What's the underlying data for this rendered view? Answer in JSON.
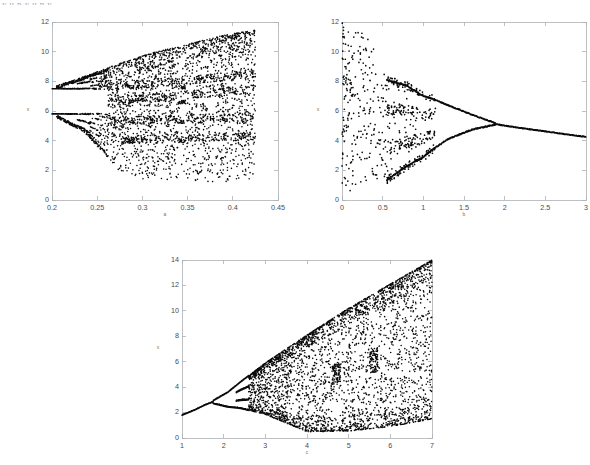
{
  "page": {
    "background_color": "#ffffff",
    "width": 590,
    "height": 465,
    "top_edge_artifact": "y u p  y  u p y",
    "axis_color": "#aeb0b3",
    "dot_color": "#0b0b0b",
    "tick_label_color": "#4a4c4f"
  },
  "chart_data": [
    {
      "id": "top-left",
      "type": "scatter",
      "title": "",
      "subtitle": "",
      "xlabel": "a",
      "ylabel": "x",
      "xlim": [
        0.2,
        0.45
      ],
      "ylim": [
        0,
        12
      ],
      "xticks": [
        0.2,
        0.25,
        0.3,
        0.35,
        0.4,
        0.45
      ],
      "xticklabels": [
        "0.2",
        "0.25",
        "0.3",
        "0.35",
        "0.4",
        "0.45"
      ],
      "yticks": [
        0,
        2,
        4,
        6,
        8,
        10,
        12
      ],
      "yticklabels": [
        "0",
        "2",
        "4",
        "6",
        "8",
        "10",
        "12"
      ],
      "grid": false,
      "legend": "none",
      "box": true,
      "description": "Period-doubling route to chaos; data spans x from 0.2 to about 0.425, attractor fans out from two branches near y=5.8 and y=7.5 into a broad chaotic band rising to y=11.4 at the right edge and descending to y=1.2 at the bottom.",
      "point_count": 4200,
      "param_start": 0.2,
      "param_end": 0.425,
      "branch_seeds": [
        5.8,
        7.5
      ],
      "upper_envelope": [
        [
          0.2,
          7.6
        ],
        [
          0.235,
          8.3
        ],
        [
          0.27,
          9.1
        ],
        [
          0.31,
          9.9
        ],
        [
          0.35,
          10.5
        ],
        [
          0.39,
          11.1
        ],
        [
          0.425,
          11.45
        ]
      ],
      "lower_envelope": [
        [
          0.2,
          5.7
        ],
        [
          0.235,
          4.6
        ],
        [
          0.26,
          3.0
        ],
        [
          0.275,
          1.9
        ],
        [
          0.3,
          1.35
        ],
        [
          0.35,
          1.25
        ],
        [
          0.425,
          1.2
        ]
      ],
      "bifurcation_points": [
        0.205,
        0.228,
        0.242,
        0.252,
        0.262
      ],
      "dense_bands": [
        7.6,
        6.6,
        5.3,
        4.0
      ],
      "window_gaps": [
        [
          0.285,
          0.292
        ],
        [
          0.34,
          0.348
        ]
      ]
    },
    {
      "id": "top-right",
      "type": "scatter",
      "title": "",
      "subtitle": "",
      "xlabel": "b",
      "ylabel": "x",
      "xlim": [
        0,
        3
      ],
      "ylim": [
        0,
        12
      ],
      "xticks": [
        0,
        0.5,
        1,
        1.5,
        2,
        2.5,
        3
      ],
      "xticklabels": [
        "0",
        "0.5",
        "1",
        "1.5",
        "2",
        "2.5",
        "3"
      ],
      "yticks": [
        0,
        2,
        4,
        6,
        8,
        10,
        12
      ],
      "yticklabels": [
        "0",
        "2",
        "4",
        "6",
        "8",
        "10",
        "12"
      ],
      "grid": false,
      "legend": "none",
      "box": true,
      "description": "Reverse period-doubling (period-halving) cascade. Chaotic scatter fills x<0.55 spanning y from 0.4 to 12, then collapses through period-8 and period-4 bands, merges to two branches near x=1.15, which converge at about x=1.9, y=5.1 and continue as a single branch falling to y=4.25 at x=3.",
      "point_count": 1500,
      "chaos_end": 0.55,
      "merge_points": [
        1.05,
        1.15,
        1.9
      ],
      "final_value_at_xmax": 4.25,
      "merge_value": 5.1,
      "upper_branch": [
        [
          0.55,
          8.1
        ],
        [
          0.8,
          7.7
        ],
        [
          1.0,
          7.0
        ],
        [
          1.1,
          6.85
        ],
        [
          1.3,
          6.4
        ],
        [
          1.6,
          5.75
        ],
        [
          1.9,
          5.15
        ]
      ],
      "lower_branch": [
        [
          0.55,
          1.35
        ],
        [
          0.8,
          2.3
        ],
        [
          1.0,
          2.9
        ],
        [
          1.1,
          3.35
        ],
        [
          1.3,
          4.1
        ],
        [
          1.6,
          4.75
        ],
        [
          1.9,
          5.1
        ]
      ],
      "single_branch": [
        [
          1.9,
          5.1
        ],
        [
          2.2,
          4.85
        ],
        [
          2.6,
          4.55
        ],
        [
          3.0,
          4.25
        ]
      ]
    },
    {
      "id": "bottom",
      "type": "scatter",
      "title": "",
      "subtitle": "",
      "xlabel": "c",
      "ylabel": "x",
      "xlim": [
        1,
        7
      ],
      "ylim": [
        0,
        14
      ],
      "xticks": [
        1,
        2,
        3,
        4,
        5,
        6,
        7
      ],
      "xticklabels": [
        "1",
        "2",
        "3",
        "4",
        "5",
        "6",
        "7"
      ],
      "yticks": [
        0,
        2,
        4,
        6,
        8,
        10,
        12,
        14
      ],
      "yticklabels": [
        "0",
        "2",
        "4",
        "6",
        "8",
        "10",
        "12",
        "14"
      ],
      "grid": false,
      "legend": "none",
      "box": true,
      "description": "Classic period-doubling bifurcation. A single fixed-point branch starts at (1, 1.8), rises to the first pitchfork at x=1.75, splits again near x=2.3, then becomes chaotic past x=2.6 with a wedge that widens to the full range 0.45 to 14 at x=7.",
      "point_count": 4500,
      "fixed_point_start": 1.8,
      "first_bifurcation": 1.75,
      "second_bifurcation": 2.3,
      "chaos_onset": 2.6,
      "fixed_branch": [
        [
          1.0,
          1.8
        ],
        [
          1.3,
          2.2
        ],
        [
          1.55,
          2.6
        ],
        [
          1.75,
          2.85
        ]
      ],
      "upper_envelope": [
        [
          1.75,
          2.95
        ],
        [
          2.1,
          3.6
        ],
        [
          2.4,
          4.4
        ],
        [
          3.0,
          5.9
        ],
        [
          4.0,
          8.1
        ],
        [
          5.0,
          10.2
        ],
        [
          6.0,
          12.1
        ],
        [
          7.0,
          14.0
        ]
      ],
      "lower_envelope": [
        [
          1.75,
          2.72
        ],
        [
          2.1,
          2.45
        ],
        [
          2.4,
          2.35
        ],
        [
          3.0,
          1.85
        ],
        [
          4.0,
          0.5
        ],
        [
          5.0,
          0.55
        ],
        [
          6.0,
          0.9
        ],
        [
          7.0,
          1.5
        ]
      ],
      "dense_bands": [
        13.0,
        10.5,
        6.2,
        2.1
      ],
      "window_gaps": [
        [
          4.6,
          4.8
        ],
        [
          5.5,
          5.7
        ]
      ]
    }
  ],
  "panels": [
    {
      "name": "top-left-panel",
      "left": 14,
      "top": 12,
      "width": 264,
      "height": 200,
      "plot_left": 38,
      "plot_top": 10,
      "plot_width": 226,
      "plot_height": 178
    },
    {
      "name": "top-right-panel",
      "left": 322,
      "top": 12,
      "width": 264,
      "height": 200,
      "plot_left": 20,
      "plot_top": 10,
      "plot_width": 244,
      "plot_height": 178
    },
    {
      "name": "bottom-panel",
      "left": 150,
      "top": 250,
      "width": 300,
      "height": 206,
      "plot_left": 32,
      "plot_top": 10,
      "plot_width": 250,
      "plot_height": 178
    }
  ]
}
